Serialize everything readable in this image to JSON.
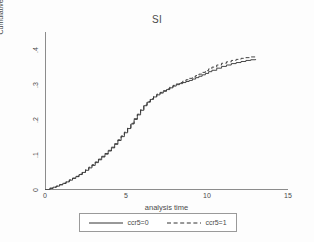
{
  "chart_data": {
    "type": "line",
    "title": "SI",
    "xlabel": "analysis time",
    "ylabel": "Cumulative Incidence",
    "xlim": [
      0,
      15
    ],
    "ylim": [
      0,
      0.45
    ],
    "xticks": [
      "0",
      "5",
      "10",
      "15"
    ],
    "xtick_values": [
      0,
      5,
      10,
      15
    ],
    "yticks": [
      "0",
      ".1",
      ".2",
      ".3",
      ".4"
    ],
    "ytick_values": [
      0,
      0.1,
      0.2,
      0.3,
      0.4
    ],
    "grid": false,
    "legend_position": "below",
    "step": true,
    "series": [
      {
        "name": "ccr5=0",
        "style": "solid",
        "color": "#333333",
        "x": [
          0.0,
          0.3,
          0.5,
          0.7,
          0.9,
          1.1,
          1.3,
          1.5,
          1.7,
          1.9,
          2.1,
          2.3,
          2.5,
          2.7,
          2.9,
          3.1,
          3.3,
          3.5,
          3.7,
          3.9,
          4.1,
          4.3,
          4.5,
          4.7,
          4.9,
          5.1,
          5.3,
          5.5,
          5.7,
          5.9,
          6.1,
          6.3,
          6.5,
          6.7,
          6.9,
          7.1,
          7.3,
          7.5,
          7.7,
          7.9,
          8.1,
          8.3,
          8.5,
          8.7,
          8.9,
          9.1,
          9.3,
          9.5,
          9.7,
          9.9,
          10.1,
          10.3,
          10.6,
          10.9,
          11.2,
          11.5,
          11.8,
          12.1,
          12.4,
          12.7,
          13.0
        ],
        "y": [
          0.0,
          0.005,
          0.008,
          0.011,
          0.015,
          0.019,
          0.023,
          0.028,
          0.033,
          0.038,
          0.044,
          0.05,
          0.056,
          0.063,
          0.07,
          0.078,
          0.086,
          0.094,
          0.102,
          0.111,
          0.12,
          0.13,
          0.141,
          0.152,
          0.163,
          0.175,
          0.188,
          0.201,
          0.214,
          0.227,
          0.24,
          0.25,
          0.258,
          0.265,
          0.271,
          0.276,
          0.281,
          0.286,
          0.291,
          0.296,
          0.3,
          0.303,
          0.306,
          0.309,
          0.312,
          0.316,
          0.32,
          0.324,
          0.328,
          0.332,
          0.337,
          0.341,
          0.347,
          0.352,
          0.356,
          0.36,
          0.363,
          0.366,
          0.369,
          0.371,
          0.373
        ]
      },
      {
        "name": "ccr5=1",
        "style": "dashed",
        "color": "#333333",
        "x": [
          0.0,
          0.3,
          0.5,
          0.7,
          0.9,
          1.1,
          1.3,
          1.5,
          1.7,
          1.9,
          2.1,
          2.3,
          2.5,
          2.7,
          2.9,
          3.1,
          3.3,
          3.5,
          3.7,
          3.9,
          4.1,
          4.3,
          4.5,
          4.7,
          4.9,
          5.1,
          5.3,
          5.5,
          5.7,
          5.9,
          6.1,
          6.3,
          6.5,
          6.7,
          6.9,
          7.1,
          7.3,
          7.5,
          7.7,
          7.9,
          8.1,
          8.3,
          8.5,
          8.7,
          8.9,
          9.1,
          9.3,
          9.5,
          9.7,
          9.9,
          10.1,
          10.3,
          10.6,
          10.9,
          11.2,
          11.5,
          11.8,
          12.1,
          12.4,
          12.7,
          13.0
        ],
        "y": [
          0.0,
          0.005,
          0.008,
          0.011,
          0.015,
          0.019,
          0.024,
          0.029,
          0.034,
          0.039,
          0.045,
          0.051,
          0.058,
          0.065,
          0.072,
          0.08,
          0.088,
          0.096,
          0.104,
          0.113,
          0.122,
          0.132,
          0.143,
          0.154,
          0.165,
          0.177,
          0.19,
          0.203,
          0.216,
          0.229,
          0.242,
          0.252,
          0.26,
          0.267,
          0.273,
          0.278,
          0.283,
          0.288,
          0.293,
          0.298,
          0.302,
          0.306,
          0.31,
          0.314,
          0.318,
          0.322,
          0.326,
          0.33,
          0.335,
          0.34,
          0.345,
          0.35,
          0.356,
          0.361,
          0.365,
          0.369,
          0.372,
          0.375,
          0.377,
          0.379,
          0.38
        ]
      }
    ]
  },
  "legend": {
    "entries": [
      {
        "label": "ccr5=0",
        "style": "solid"
      },
      {
        "label": "ccr5=1",
        "style": "dashed"
      }
    ]
  },
  "colors": {
    "axis": "#8c8c8c",
    "text": "#4a4a4a",
    "line": "#333333",
    "background": "#fdfdfd"
  }
}
